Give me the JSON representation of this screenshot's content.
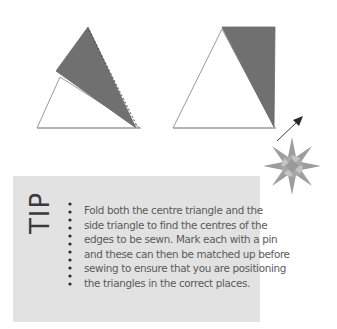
{
  "diagrams": {
    "left": {
      "description": "centre triangle with side triangle folded over along dashed line",
      "base_triangle_fill": "#ffffff",
      "folded_triangle_fill": "#6e6e6e",
      "outline_color": "#9a9a9a",
      "fold_line": "dashed"
    },
    "right": {
      "description": "centre triangle with side triangle sewn in place",
      "base_triangle_fill": "#ffffff",
      "side_triangle_fill": "#6e6e6e",
      "outline_color": "#9a9a9a"
    },
    "arrow": {
      "icon": "arrow-up-right-icon",
      "color": "#3a3a3a"
    }
  },
  "tip": {
    "label": "TIP",
    "lines": [
      "Fold both the centre triangle and the",
      "side triangle to find the centres of the",
      "edges to be sewn. Mark each with a pin",
      "and these can then be matched up before",
      "sewing to ensure that you are positioning",
      "the triangles in the correct places."
    ],
    "background": "#e2e2e2",
    "decoration_icon": "eight-point-star-icon"
  }
}
